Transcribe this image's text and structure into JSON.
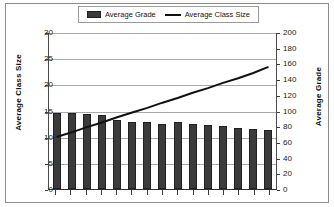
{
  "chart_data": {
    "type": "bar",
    "title": "",
    "subtitle": "",
    "xlabel": "",
    "legend_position": "top-center",
    "grid": true,
    "categories": [
      "1",
      "2",
      "3",
      "4",
      "5",
      "6",
      "7",
      "8",
      "9",
      "10",
      "11",
      "12",
      "13",
      "14",
      "15"
    ],
    "x_tick_labels": [],
    "axes": {
      "left": {
        "title": "Average Class Size",
        "min": 0,
        "max": 30,
        "step": 5,
        "ticks": [
          0,
          5,
          10,
          15,
          20,
          25,
          30
        ],
        "tick_labels": [
          "0",
          "5",
          "10",
          "15",
          "20",
          "25",
          "30"
        ]
      },
      "right": {
        "title": "Average Grade",
        "min": 0,
        "max": 200,
        "step": 20,
        "ticks": [
          0,
          20,
          40,
          60,
          80,
          100,
          120,
          140,
          160,
          180,
          200
        ],
        "tick_labels": [
          "0",
          "20",
          "40",
          "60",
          "80",
          "100",
          "120",
          "140",
          "160",
          "180",
          "200"
        ]
      }
    },
    "series": [
      {
        "name": "Average Grade",
        "type": "bar",
        "axis": "right",
        "color": "#3b3b3b",
        "values": [
          97,
          97,
          95,
          94,
          88,
          86,
          86,
          83,
          85,
          83,
          82,
          80,
          78,
          76,
          75
        ]
      },
      {
        "name": "Average Class Size",
        "type": "line",
        "axis": "left",
        "color": "#111111",
        "values": [
          10.0,
          10.9,
          11.9,
          12.8,
          13.8,
          14.7,
          15.6,
          16.6,
          17.5,
          18.5,
          19.4,
          20.4,
          21.3,
          22.3,
          23.5
        ]
      }
    ]
  },
  "legend": {
    "entries": [
      {
        "label": "Average Grade",
        "marker": "bar-swatch-icon"
      },
      {
        "label": "Average Class Size",
        "marker": "line-swatch-icon"
      }
    ]
  }
}
